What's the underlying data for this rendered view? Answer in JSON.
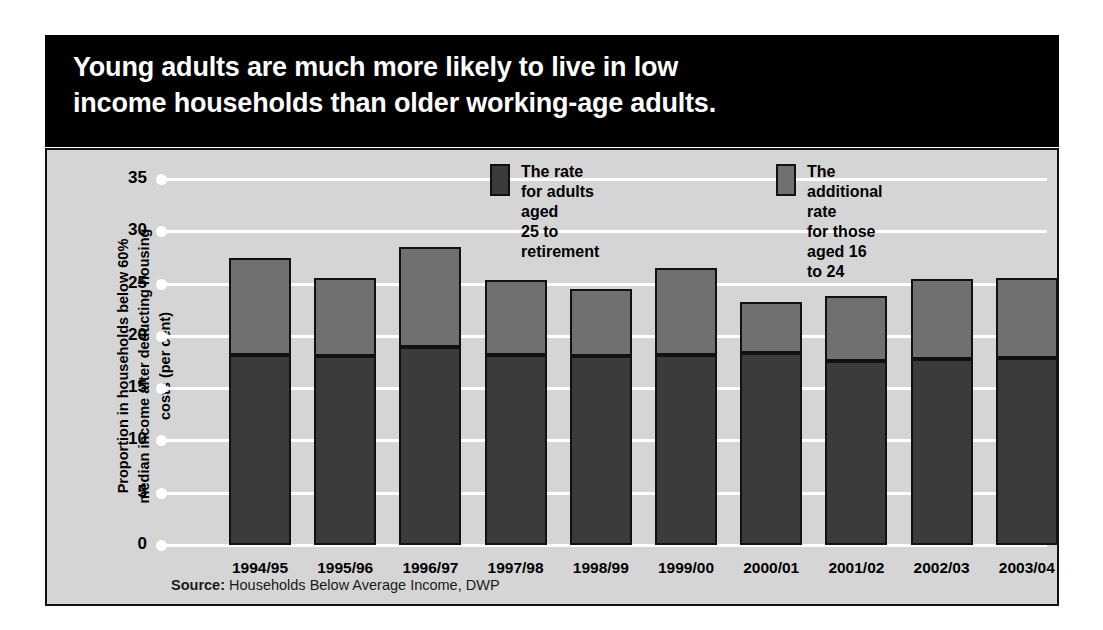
{
  "title": "Young adults are much more likely to live in low\nincome households than older working-age adults.",
  "legend": [
    {
      "key": "adults-25-to-retirement",
      "swatch": "dark",
      "color": "#3b3b3b",
      "label": "The rate for adults aged\n25 to retirement"
    },
    {
      "key": "additional-16-to-24",
      "swatch": "light",
      "color": "#707070",
      "label": "The additional rate\nfor those aged 16 to 24"
    }
  ],
  "source": {
    "label": "Source:",
    "text": " Households Below Average Income, DWP"
  },
  "colors": {
    "panel_background": "#d5d5d5",
    "title_background": "#000000",
    "title_text": "#ffffff",
    "gridline": "#ffffff",
    "series_lower": "#3b3b3b",
    "series_upper": "#707070",
    "outline": "#111111"
  },
  "chart_data": {
    "type": "bar",
    "stacked": true,
    "title": "Young adults are much more likely to live in low income households than older working-age adults.",
    "xlabel": "",
    "ylabel": "Proportion in households below 60%\nmedian income after deducting housing\ncosts (per cent)",
    "ylim": [
      0,
      35
    ],
    "yticks": [
      0,
      5,
      10,
      15,
      20,
      25,
      30,
      35
    ],
    "ytick_labels": [
      "0",
      "5",
      "10",
      "15",
      "20",
      "25",
      "30",
      "35"
    ],
    "grid": true,
    "legend_position": "top-right",
    "categories": [
      "1994/95",
      "1995/96",
      "1996/97",
      "1997/98",
      "1998/99",
      "1999/00",
      "2000/01",
      "2001/02",
      "2002/03",
      "2003/04"
    ],
    "series": [
      {
        "name": "The rate for adults aged 25 to retirement",
        "color": "#3b3b3b",
        "values": [
          18.2,
          18.1,
          18.9,
          18.2,
          18.1,
          18.2,
          18.4,
          17.6,
          17.8,
          17.9
        ]
      },
      {
        "name": "The additional rate for those aged 16 to 24",
        "color": "#707070",
        "values": [
          9.2,
          7.4,
          9.6,
          7.1,
          6.4,
          8.3,
          4.8,
          6.2,
          7.6,
          7.6
        ]
      }
    ],
    "totals": [
      27.4,
      25.5,
      28.5,
      25.3,
      24.5,
      26.5,
      23.2,
      23.8,
      25.4,
      25.5
    ],
    "source": "Source: Households Below Average Income, DWP"
  }
}
